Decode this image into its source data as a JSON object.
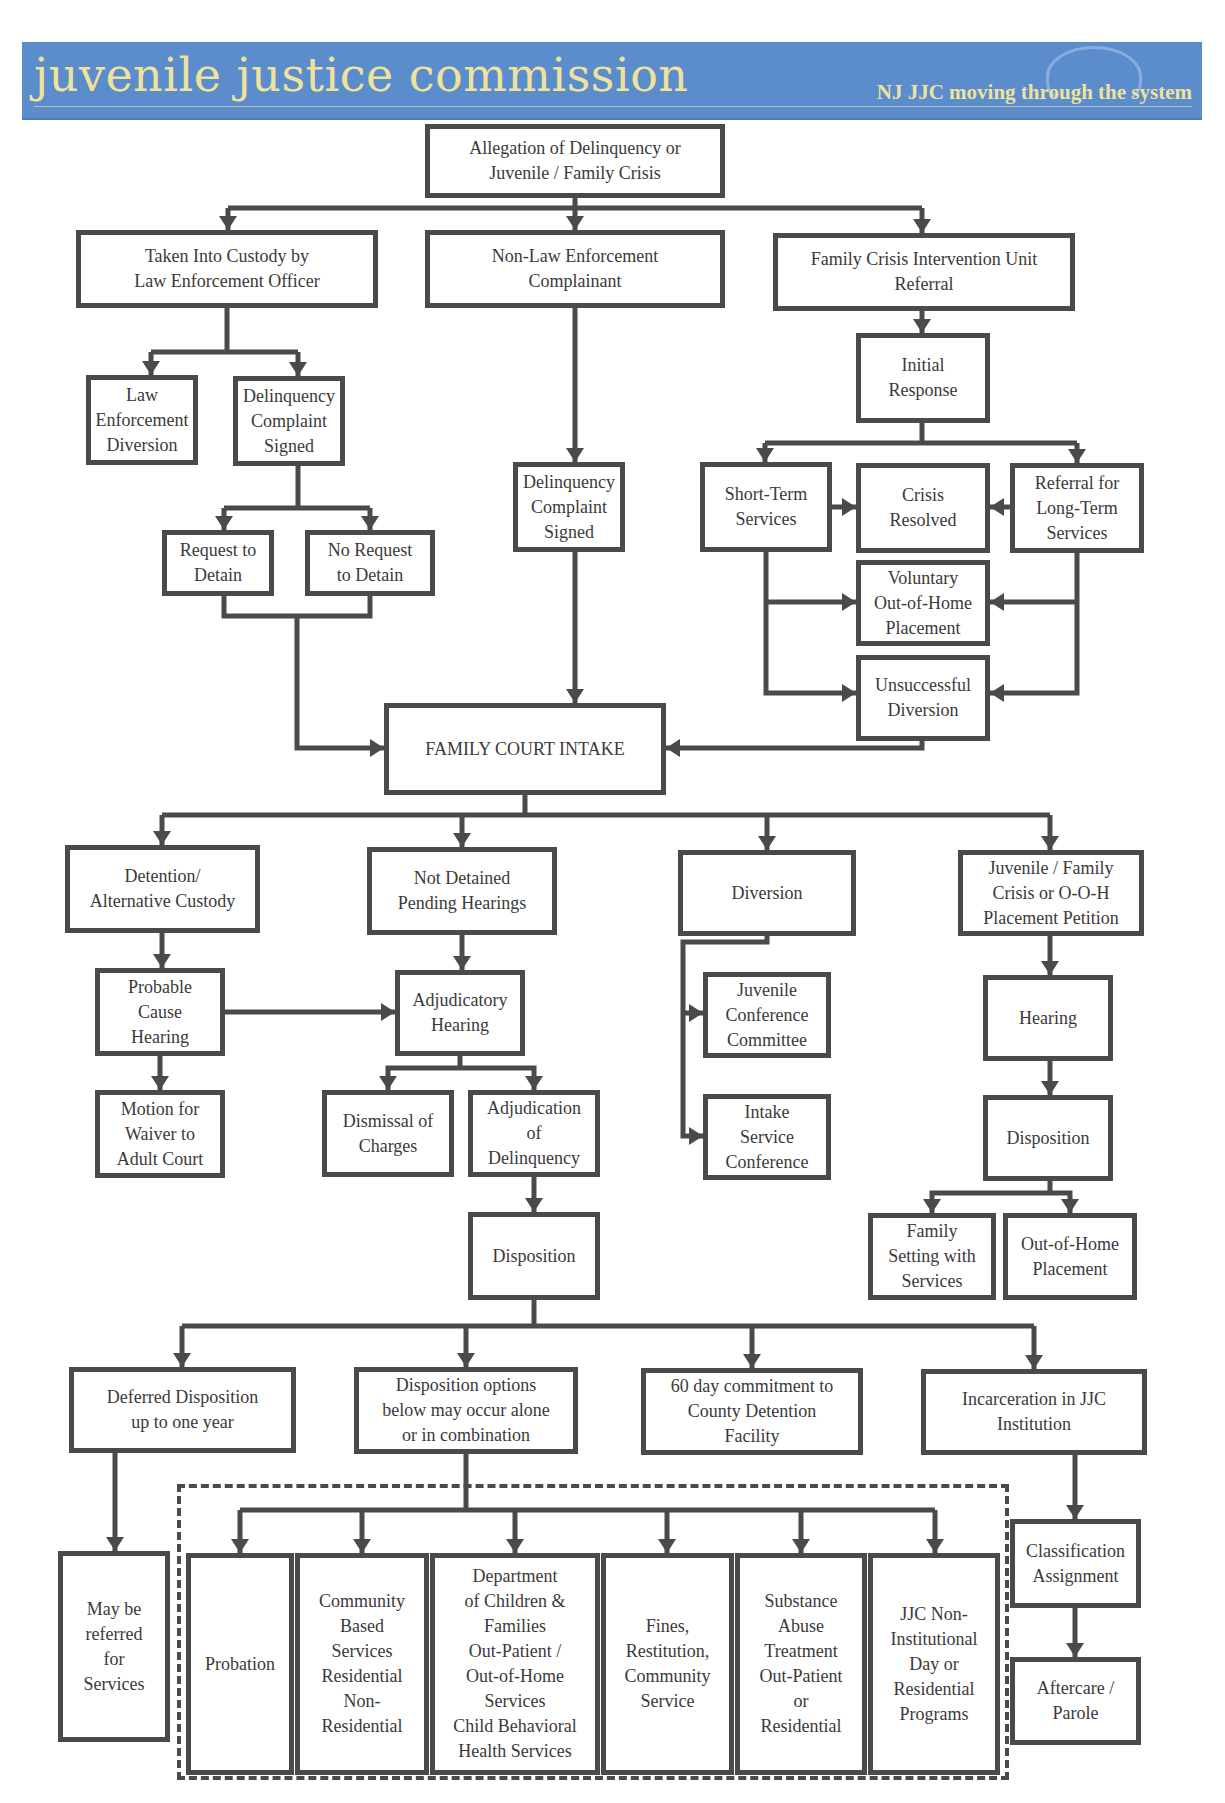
{
  "header": {
    "title": "juvenile justice commission",
    "tagline": "NJ JJC moving through the system",
    "colors": {
      "banner": "#5b8ccc",
      "text": "#efe29a"
    }
  },
  "colors": {
    "line": "#4a4a4a",
    "box_border": "#4a4a4a",
    "text": "#3a3a3a"
  },
  "boxes": [
    {
      "id": "allegation",
      "label": "Allegation of Delinquency or\nJuvenile / Family Crisis",
      "x": 425,
      "y": 124,
      "w": 300,
      "h": 74
    },
    {
      "id": "taken-into-custody",
      "label": "Taken Into Custody by\nLaw Enforcement Officer",
      "x": 76,
      "y": 230,
      "w": 302,
      "h": 78
    },
    {
      "id": "non-law-enforcement",
      "label": "Non-Law Enforcement\nComplainant",
      "x": 425,
      "y": 230,
      "w": 300,
      "h": 78
    },
    {
      "id": "fciu-referral",
      "label": "Family Crisis Intervention Unit\nReferral",
      "x": 773,
      "y": 233,
      "w": 302,
      "h": 78
    },
    {
      "id": "initial-response",
      "label": "Initial\nResponse",
      "x": 856,
      "y": 333,
      "w": 134,
      "h": 90
    },
    {
      "id": "le-diversion",
      "label": "Law\nEnforcement\nDiversion",
      "x": 86,
      "y": 375,
      "w": 112,
      "h": 90
    },
    {
      "id": "complaint-signed-1",
      "label": "Delinquency\nComplaint\nSigned",
      "x": 233,
      "y": 376,
      "w": 112,
      "h": 90
    },
    {
      "id": "short-term",
      "label": "Short-Term\nServices",
      "x": 700,
      "y": 462,
      "w": 132,
      "h": 90
    },
    {
      "id": "crisis-resolved",
      "label": "Crisis\nResolved",
      "x": 856,
      "y": 463,
      "w": 134,
      "h": 90
    },
    {
      "id": "long-term-referral",
      "label": "Referral for\nLong-Term\nServices",
      "x": 1010,
      "y": 463,
      "w": 134,
      "h": 90
    },
    {
      "id": "complaint-signed-2",
      "label": "Delinquency\nComplaint\nSigned",
      "x": 513,
      "y": 462,
      "w": 112,
      "h": 90
    },
    {
      "id": "request-detain",
      "label": "Request to\nDetain",
      "x": 162,
      "y": 530,
      "w": 112,
      "h": 66
    },
    {
      "id": "no-request-detain",
      "label": "No Request\nto Detain",
      "x": 305,
      "y": 530,
      "w": 130,
      "h": 66
    },
    {
      "id": "voluntary-ooh",
      "label": "Voluntary\nOut-of-Home\nPlacement",
      "x": 856,
      "y": 560,
      "w": 134,
      "h": 86
    },
    {
      "id": "unsuccessful-diversion",
      "label": "Unsuccessful\nDiversion",
      "x": 856,
      "y": 655,
      "w": 134,
      "h": 86
    },
    {
      "id": "family-court-intake",
      "label": "FAMILY COURT INTAKE",
      "x": 384,
      "y": 703,
      "w": 282,
      "h": 92
    },
    {
      "id": "detention-alt",
      "label": "Detention/\nAlternative Custody",
      "x": 65,
      "y": 845,
      "w": 195,
      "h": 88
    },
    {
      "id": "not-detained",
      "label": "Not Detained\nPending Hearings",
      "x": 367,
      "y": 847,
      "w": 190,
      "h": 88
    },
    {
      "id": "diversion",
      "label": "Diversion",
      "x": 678,
      "y": 850,
      "w": 178,
      "h": 86
    },
    {
      "id": "jf-crisis-petition",
      "label": "Juvenile / Family\nCrisis or O-O-H\nPlacement Petition",
      "x": 958,
      "y": 850,
      "w": 186,
      "h": 86
    },
    {
      "id": "probable-cause",
      "label": "Probable\nCause\nHearing",
      "x": 95,
      "y": 968,
      "w": 130,
      "h": 88
    },
    {
      "id": "adjudicatory-hearing",
      "label": "Adjudicatory\nHearing",
      "x": 395,
      "y": 970,
      "w": 130,
      "h": 86
    },
    {
      "id": "jcc",
      "label": "Juvenile\nConference\nCommittee",
      "x": 703,
      "y": 972,
      "w": 128,
      "h": 86
    },
    {
      "id": "hearing-2",
      "label": "Hearing",
      "x": 983,
      "y": 975,
      "w": 130,
      "h": 86
    },
    {
      "id": "waiver-motion",
      "label": "Motion for\nWaiver to\nAdult Court",
      "x": 95,
      "y": 1090,
      "w": 130,
      "h": 88
    },
    {
      "id": "dismissal",
      "label": "Dismissal of\nCharges",
      "x": 322,
      "y": 1090,
      "w": 132,
      "h": 87
    },
    {
      "id": "adjudication-delinquency",
      "label": "Adjudication\nof\nDelinquency",
      "x": 468,
      "y": 1090,
      "w": 132,
      "h": 87
    },
    {
      "id": "intake-service-conf",
      "label": "Intake\nService\nConference",
      "x": 703,
      "y": 1094,
      "w": 128,
      "h": 86
    },
    {
      "id": "disposition-2",
      "label": "Disposition",
      "x": 983,
      "y": 1095,
      "w": 130,
      "h": 86
    },
    {
      "id": "disposition-1",
      "label": "Disposition",
      "x": 468,
      "y": 1212,
      "w": 132,
      "h": 88
    },
    {
      "id": "family-setting",
      "label": "Family\nSetting with\nServices",
      "x": 868,
      "y": 1213,
      "w": 128,
      "h": 87
    },
    {
      "id": "ooh-placement",
      "label": "Out-of-Home\nPlacement",
      "x": 1003,
      "y": 1213,
      "w": 134,
      "h": 87
    },
    {
      "id": "deferred-disposition",
      "label": "Deferred Disposition\nup to one year",
      "x": 69,
      "y": 1367,
      "w": 227,
      "h": 86
    },
    {
      "id": "disposition-options",
      "label": "Disposition options\nbelow may occur alone\nor in combination",
      "x": 354,
      "y": 1367,
      "w": 224,
      "h": 87
    },
    {
      "id": "county-detention",
      "label": "60 day commitment to\nCounty Detention\nFacility",
      "x": 641,
      "y": 1368,
      "w": 222,
      "h": 87
    },
    {
      "id": "jjc-incarceration",
      "label": "Incarceration in JJC\nInstitution",
      "x": 921,
      "y": 1369,
      "w": 226,
      "h": 86
    },
    {
      "id": "classification",
      "label": "Classification\nAssignment",
      "x": 1010,
      "y": 1519,
      "w": 131,
      "h": 89
    },
    {
      "id": "referred-services",
      "label": "May be\nreferred\nfor\nServices",
      "x": 58,
      "y": 1551,
      "w": 112,
      "h": 191
    },
    {
      "id": "probation",
      "label": "Probation",
      "x": 186,
      "y": 1553,
      "w": 108,
      "h": 222
    },
    {
      "id": "community-services",
      "label": "Community\nBased\nServices\nResidential\nNon-\nResidential",
      "x": 295,
      "y": 1553,
      "w": 134,
      "h": 222
    },
    {
      "id": "dcf-services",
      "label": "Department\nof Children &\nFamilies\nOut-Patient /\nOut-of-Home\nServices\nChild Behavioral\nHealth Services",
      "x": 430,
      "y": 1553,
      "w": 170,
      "h": 222
    },
    {
      "id": "fines-restitution",
      "label": "Fines,\nRestitution,\nCommunity\nService",
      "x": 601,
      "y": 1553,
      "w": 133,
      "h": 222
    },
    {
      "id": "substance-abuse",
      "label": "Substance\nAbuse\nTreatment\nOut-Patient\nor\nResidential",
      "x": 735,
      "y": 1553,
      "w": 132,
      "h": 222
    },
    {
      "id": "jjc-non-institutional",
      "label": "JJC Non-\nInstitutional\nDay or\nResidential\nPrograms",
      "x": 868,
      "y": 1553,
      "w": 132,
      "h": 222
    },
    {
      "id": "aftercare-parole",
      "label": "Aftercare /\nParole",
      "x": 1010,
      "y": 1657,
      "w": 131,
      "h": 88
    }
  ],
  "dashed_group": {
    "label": "disposition-options-group",
    "x": 177,
    "y": 1484,
    "w": 832,
    "h": 296
  },
  "connectors": {
    "lines": [
      "M575 198 V208 M228 208 H922 M228 208 V230 M575 208 V230 M922 208 V233",
      "M227 308 V352 M151 352 H298 M151 352 V375 M298 352 V376",
      "M575 308 V462",
      "M922 311 V333",
      "M922 423 V443 M765 443 H1077 M765 443 V462 M1077 443 V463",
      "M832 507 H856 M1010 507 H990",
      "M766 552 V693 H856 M766 602 H856",
      "M1077 553 V693 H990 M1077 602 H990",
      "M298 466 V508 M224 508 H370 M224 508 V530 M370 508 V530",
      "M224 596 V616 H370 V596 M297 616 V748 H384",
      "M575 552 V703",
      "M922 741 V748 H666",
      "M525 795 V815 M162 815 H1050 M162 815 V845 M462 815 V847 M767 815 V850 M1050 815 V850",
      "M162 933 V968",
      "M462 935 V970",
      "M767 936 V942 H683 V1136 H703 M683 1013 H703",
      "M1050 936 V975",
      "M225 1012 H395",
      "M160 1056 V1090",
      "M460 1056 V1068 H388 V1090 M460 1068 H534 V1090",
      "M534 1177 V1212",
      "M1050 1061 V1095",
      "M1050 1181 V1193 H932 V1213 M1050 1193 H1070 V1213",
      "M534 1300 V1326 M182 1326 H1034 M182 1326 V1367 M466 1326 V1367 M752 1326 V1368 M1034 1326 V1369",
      "M115 1453 V1551",
      "M466 1454 V1510 M240 1510 H935 M240 1510 V1553 M362 1510 V1553 M515 1510 V1553 M667 1510 V1553 M801 1510 V1553 M935 1510 V1553",
      "M1075 1455 V1519",
      "M1075 1608 V1657"
    ],
    "arrows_down": [
      [
        228,
        230
      ],
      [
        575,
        230
      ],
      [
        922,
        233
      ],
      [
        151,
        375
      ],
      [
        298,
        376
      ],
      [
        575,
        462
      ],
      [
        922,
        333
      ],
      [
        765,
        462
      ],
      [
        1077,
        463
      ],
      [
        224,
        530
      ],
      [
        370,
        530
      ],
      [
        575,
        703
      ],
      [
        162,
        845
      ],
      [
        462,
        847
      ],
      [
        767,
        850
      ],
      [
        1050,
        850
      ],
      [
        162,
        968
      ],
      [
        462,
        970
      ],
      [
        1050,
        975
      ],
      [
        160,
        1090
      ],
      [
        388,
        1090
      ],
      [
        534,
        1090
      ],
      [
        534,
        1212
      ],
      [
        1050,
        1095
      ],
      [
        932,
        1213
      ],
      [
        1070,
        1213
      ],
      [
        182,
        1367
      ],
      [
        466,
        1367
      ],
      [
        752,
        1368
      ],
      [
        1034,
        1369
      ],
      [
        115,
        1551
      ],
      [
        240,
        1553
      ],
      [
        362,
        1553
      ],
      [
        515,
        1553
      ],
      [
        667,
        1553
      ],
      [
        801,
        1553
      ],
      [
        935,
        1553
      ],
      [
        1075,
        1519
      ],
      [
        1075,
        1657
      ]
    ],
    "arrows_right": [
      [
        856,
        507
      ],
      [
        856,
        602
      ],
      [
        856,
        693
      ],
      [
        384,
        748
      ],
      [
        703,
        1013
      ],
      [
        703,
        1136
      ],
      [
        395,
        1012
      ]
    ],
    "arrows_left": [
      [
        990,
        507
      ],
      [
        990,
        602
      ],
      [
        990,
        693
      ],
      [
        666,
        748
      ]
    ]
  }
}
